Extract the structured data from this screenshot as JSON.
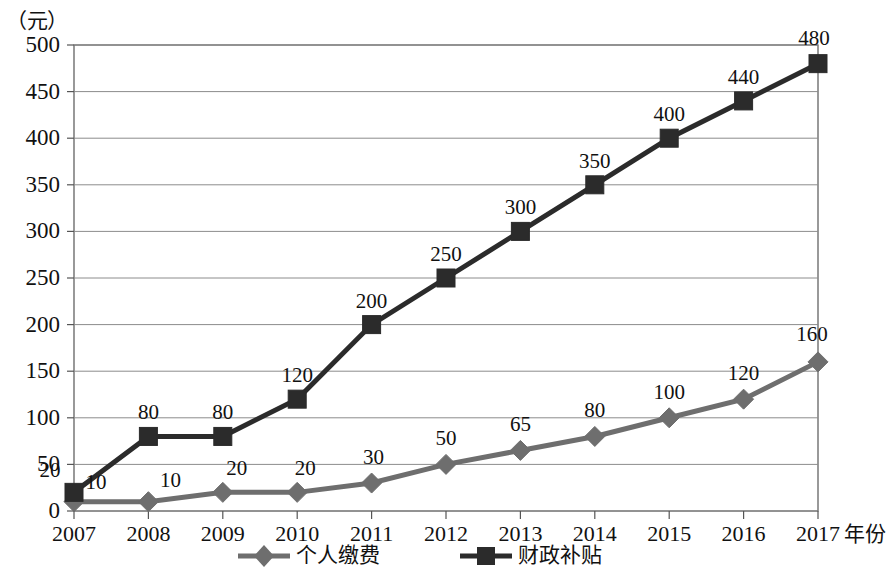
{
  "chart_data": {
    "type": "line",
    "title": "",
    "xlabel": "年份",
    "ylabel": "（元）",
    "ylim": [
      0,
      500
    ],
    "ytick_step": 50,
    "grid": true,
    "legend_position": "bottom",
    "categories": [
      "2007",
      "2008",
      "2009",
      "2010",
      "2011",
      "2012",
      "2013",
      "2014",
      "2015",
      "2016",
      "2017"
    ],
    "ytick_labels": [
      "500",
      "450",
      "400",
      "350",
      "300",
      "250",
      "200",
      "150",
      "100",
      "50",
      "0"
    ],
    "series": [
      {
        "name": "个人缴费",
        "marker": "diamond",
        "color": "#6e6e6e",
        "values": [
          10,
          10,
          20,
          20,
          30,
          50,
          65,
          80,
          100,
          120,
          160
        ],
        "labels": [
          "10",
          "10",
          "20",
          "20",
          "30",
          "50",
          "65",
          "80",
          "100",
          "120",
          "160"
        ]
      },
      {
        "name": "财政补贴",
        "marker": "square",
        "color": "#2b2b2b",
        "values": [
          20,
          80,
          80,
          120,
          200,
          250,
          300,
          350,
          400,
          440,
          480
        ],
        "labels": [
          "20",
          "80",
          "80",
          "120",
          "200",
          "250",
          "300",
          "350",
          "400",
          "440",
          "480"
        ]
      }
    ]
  },
  "colors": {
    "personal_payment": "#6e6e6e",
    "fiscal_subsidy": "#2b2b2b",
    "gridline": "#8c8c8c",
    "axis": "#555555",
    "background": "#ffffff"
  },
  "legend": {
    "items": [
      {
        "label": "个人缴费",
        "marker": "diamond-marker-icon"
      },
      {
        "label": "财政补贴",
        "marker": "square-marker-icon"
      }
    ]
  }
}
